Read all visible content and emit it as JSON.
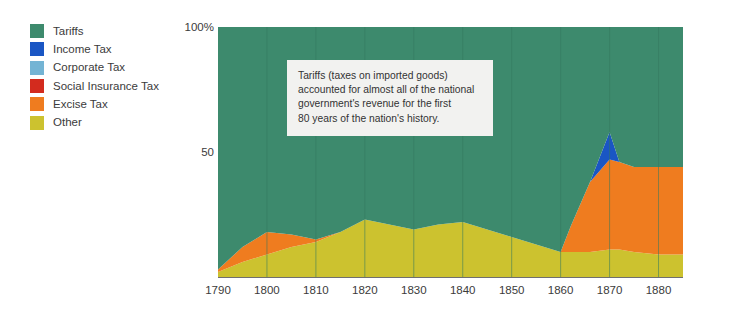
{
  "chart_data": {
    "type": "area",
    "title": "",
    "subtitle": "",
    "xlabel": "",
    "ylabel": "",
    "stacked": true,
    "grid": true,
    "grid_axis": "x",
    "legend_position": "left",
    "xlim": [
      1790,
      1885
    ],
    "ylim": [
      0,
      100
    ],
    "x_ticks": [
      1790,
      1800,
      1810,
      1820,
      1830,
      1840,
      1850,
      1860,
      1870,
      1880
    ],
    "x_tick_labels": [
      "1790",
      "1800",
      "1810",
      "1820",
      "1830",
      "1840",
      "1850",
      "1860",
      "1870",
      "1880"
    ],
    "y_ticks": [
      50,
      100
    ],
    "y_tick_labels": [
      "50",
      "100%"
    ],
    "x": [
      1790,
      1795,
      1800,
      1805,
      1810,
      1815,
      1820,
      1825,
      1830,
      1835,
      1840,
      1845,
      1850,
      1855,
      1860,
      1862,
      1866,
      1870,
      1872,
      1875,
      1880,
      1885
    ],
    "series": [
      {
        "name": "Other",
        "color": "#ccc22f",
        "values": [
          2,
          6,
          9,
          12,
          14,
          18,
          23,
          21,
          19,
          21,
          22,
          19,
          16,
          13,
          10,
          10,
          10,
          11,
          11,
          10,
          9,
          9
        ]
      },
      {
        "name": "Excise Tax",
        "color": "#ef7c1f",
        "values": [
          1,
          6,
          9,
          5,
          1,
          0,
          0,
          0,
          0,
          0,
          0,
          0,
          0,
          0,
          0,
          10,
          28,
          36,
          35,
          34,
          35,
          35
        ]
      },
      {
        "name": "Social Insurance Tax",
        "color": "#d32b1e",
        "values": [
          0,
          0,
          0,
          0,
          0,
          0,
          0,
          0,
          0,
          0,
          0,
          0,
          0,
          0,
          0,
          0,
          0,
          0,
          0,
          0,
          0,
          0
        ]
      },
      {
        "name": "Corporate Tax",
        "color": "#74b4d4",
        "values": [
          0,
          0,
          0,
          0,
          0,
          0,
          0,
          0,
          0,
          0,
          0,
          0,
          0,
          0,
          0,
          0,
          0,
          0,
          0,
          0,
          0,
          0
        ]
      },
      {
        "name": "Income Tax",
        "color": "#1a56c4",
        "values": [
          0,
          0,
          0,
          0,
          0,
          0,
          0,
          0,
          0,
          0,
          0,
          0,
          0,
          0,
          0,
          0,
          0,
          11,
          0,
          0,
          0,
          0
        ]
      },
      {
        "name": "Tariffs",
        "color": "#3d8a6d",
        "values": [
          97,
          88,
          82,
          83,
          85,
          82,
          77,
          79,
          81,
          79,
          78,
          81,
          84,
          87,
          90,
          80,
          62,
          42,
          54,
          56,
          56,
          56
        ]
      }
    ],
    "annotations": [
      {
        "name": "tariffs-note",
        "lines": [
          "Tariffs (taxes on imported goods)",
          "accounted for almost all of the national",
          "government's revenue for the first",
          "80 years of the nation's history."
        ]
      }
    ]
  },
  "legend": {
    "items": [
      {
        "label": "Tariffs",
        "color": "#3d8a6d",
        "swatch_name": "legend-swatch-tariffs"
      },
      {
        "label": "Income Tax",
        "color": "#1a56c4",
        "swatch_name": "legend-swatch-income-tax"
      },
      {
        "label": "Corporate Tax",
        "color": "#74b4d4",
        "swatch_name": "legend-swatch-corporate-tax"
      },
      {
        "label": "Social Insurance Tax",
        "color": "#d32b1e",
        "swatch_name": "legend-swatch-social-insurance-tax"
      },
      {
        "label": "Excise Tax",
        "color": "#ef7c1f",
        "swatch_name": "legend-swatch-excise-tax"
      },
      {
        "label": "Other",
        "color": "#ccc22f",
        "swatch_name": "legend-swatch-other"
      }
    ]
  },
  "axes": {
    "y_top_label": "100%",
    "y_mid_label": "50"
  },
  "annotation": {
    "line1": "Tariffs (taxes on imported goods)",
    "line2": "accounted for almost all of the national",
    "line3": "government's revenue for the first",
    "line4": "80 years of the nation's history."
  },
  "colors": {
    "background": "#ffffff",
    "gridline": "#34795f",
    "axis_line": "#6f6f6f",
    "annotation_background": "#f2f2f0",
    "text": "#3b3b3b"
  }
}
